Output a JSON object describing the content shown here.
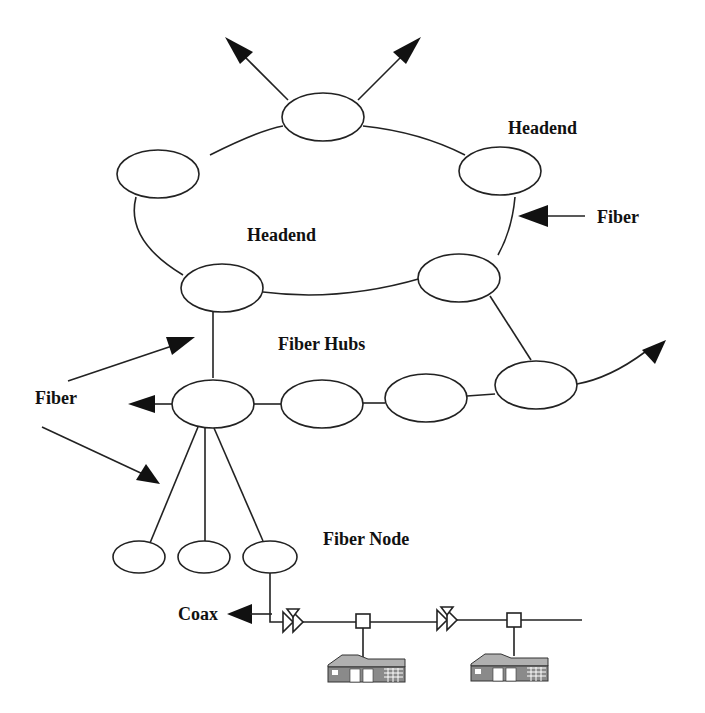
{
  "diagram": {
    "labels": {
      "headend_top": "Headend",
      "headend_ring": "Headend",
      "fiber_right": "Fiber",
      "fiber_hubs": "Fiber Hubs",
      "fiber_left": "Fiber",
      "fiber_node": "Fiber Node",
      "coax": "Coax"
    },
    "colors": {
      "line": "#222222",
      "fill": "#ffffff",
      "house_roof": "#b0b0b0",
      "house_wall": "#888888"
    },
    "nodes": {
      "headend_ring": [
        "top",
        "left",
        "right",
        "bottom-left",
        "bottom-right"
      ],
      "fiber_hubs": [
        "hub-1",
        "hub-2",
        "hub-3",
        "hub-4"
      ],
      "fiber_nodes": [
        "node-1",
        "node-2",
        "node-3"
      ]
    },
    "coax_components": [
      "amplifier",
      "tap",
      "amplifier",
      "tap"
    ],
    "houses": [
      "house-1",
      "house-2"
    ]
  }
}
